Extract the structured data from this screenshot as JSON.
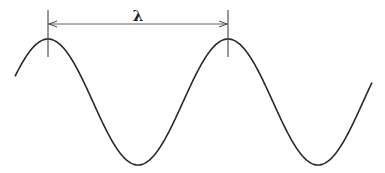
{
  "diagram": {
    "type": "sine-wave-wavelength",
    "label": "λ",
    "stroke_color": "#2a2a2a",
    "wave": {
      "x_start": 15,
      "x_end": 372,
      "center_y": 102,
      "amplitude": 63,
      "period": 180,
      "first_peak_x": 48
    },
    "markers": {
      "left_x": 48,
      "right_x": 228,
      "top_y": 10,
      "bottom_y": 57,
      "arrow_y": 24
    }
  }
}
